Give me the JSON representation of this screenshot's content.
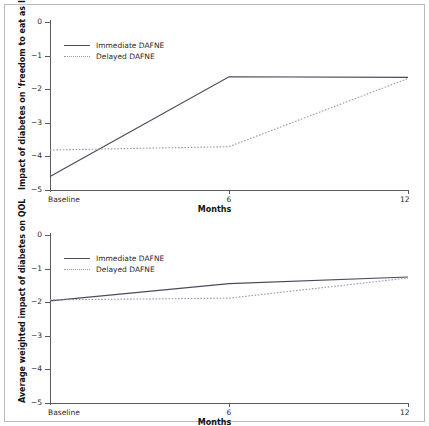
{
  "figure": {
    "panels": [
      "top",
      "bottom"
    ],
    "background": "#ffffff",
    "border_color": "#b9b9b9"
  },
  "colors": {
    "immediate": "#4a4a5e",
    "delayed": "#9a9aa8",
    "axis": "#5a5a66",
    "text": "#2b2b2b"
  },
  "legend": {
    "immediate_label": "Immediate DAFNE",
    "delayed_label": "Delayed DAFNE"
  },
  "axis": {
    "x_title": "Months",
    "x_ticks": [
      "Baseline",
      "6",
      "12"
    ],
    "x_values": [
      0,
      6,
      12
    ],
    "y_ticks": [
      "0",
      "−1",
      "−2",
      "−3",
      "−4",
      "−5"
    ],
    "y_values": [
      0,
      -1,
      -2,
      -3,
      -4,
      -5
    ]
  },
  "chart_data": [
    {
      "type": "line",
      "panel": "top",
      "title": "",
      "xlabel": "Months",
      "ylabel": "Impact of diabetes on 'freedom to eat as I wish'",
      "x": [
        0,
        6,
        12
      ],
      "xticklabels": [
        "Baseline",
        "6",
        "12"
      ],
      "xlim": [
        0,
        12
      ],
      "ylim": [
        -5,
        0
      ],
      "yticks": [
        0,
        -1,
        -2,
        -3,
        -4,
        -5
      ],
      "grid": false,
      "legend_position": "upper-left-inside",
      "series": [
        {
          "name": "Immediate DAFNE",
          "style": "solid",
          "color": "#4a4a5e",
          "values": [
            -4.6,
            -1.63,
            -1.65
          ]
        },
        {
          "name": "Delayed DAFNE",
          "style": "dotted",
          "color": "#9a9aa8",
          "values": [
            -3.81,
            -3.71,
            -1.68
          ]
        }
      ]
    },
    {
      "type": "line",
      "panel": "bottom",
      "title": "",
      "xlabel": "Months",
      "ylabel": "Average weighted impact of diabetes on QOL",
      "x": [
        0,
        6,
        12
      ],
      "xticklabels": [
        "Baseline",
        "6",
        "12"
      ],
      "xlim": [
        0,
        12
      ],
      "ylim": [
        -5,
        0
      ],
      "yticks": [
        0,
        -1,
        -2,
        -3,
        -4,
        -5
      ],
      "grid": false,
      "legend_position": "upper-left-inside",
      "series": [
        {
          "name": "Immediate DAFNE",
          "style": "solid",
          "color": "#4a4a5e",
          "values": [
            -1.96,
            -1.45,
            -1.25
          ]
        },
        {
          "name": "Delayed DAFNE",
          "style": "dotted",
          "color": "#9a9aa8",
          "values": [
            -1.93,
            -1.88,
            -1.28
          ]
        }
      ]
    }
  ]
}
